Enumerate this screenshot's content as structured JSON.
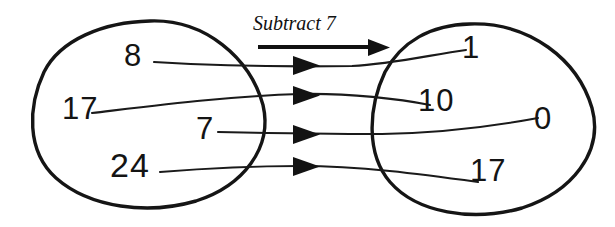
{
  "diagram": {
    "type": "mapping-diagram",
    "operation_label": "Subtract 7",
    "stroke_color": "#151515",
    "background_color": "#ffffff",
    "input_set": {
      "name": "input-oval",
      "elements": [
        {
          "value": "8",
          "x": 124,
          "y": 40
        },
        {
          "value": "17",
          "x": 62,
          "y": 93
        },
        {
          "value": "7",
          "x": 196,
          "y": 113
        },
        {
          "value": "24",
          "x": 110,
          "y": 148
        }
      ]
    },
    "output_set": {
      "name": "output-oval",
      "elements": [
        {
          "value": "1",
          "x": 462,
          "y": 32
        },
        {
          "value": "10",
          "x": 418,
          "y": 85
        },
        {
          "value": "0",
          "x": 534,
          "y": 103
        },
        {
          "value": "17",
          "x": 470,
          "y": 155
        }
      ]
    },
    "mappings": [
      {
        "from": "8",
        "to": "1",
        "arrow_y": 65
      },
      {
        "from": "17",
        "to": "10",
        "arrow_y": 95
      },
      {
        "from": "7",
        "to": "0",
        "arrow_y": 134
      },
      {
        "from": "24",
        "to": "17",
        "arrow_y": 166
      }
    ]
  }
}
